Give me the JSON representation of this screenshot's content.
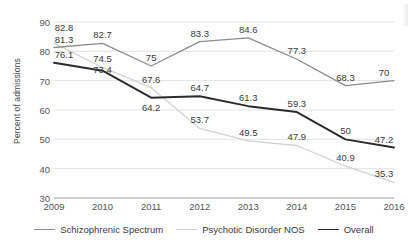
{
  "chart_data": {
    "type": "line",
    "title": "",
    "xlabel": "",
    "ylabel": "Percent of admissions",
    "categories": [
      "2009",
      "2010",
      "2011",
      "2012",
      "2013",
      "2014",
      "2015",
      "2016"
    ],
    "ylim": [
      30,
      90
    ],
    "yticks": [
      30,
      40,
      50,
      60,
      70,
      80,
      90
    ],
    "grid": true,
    "legend_position": "bottom",
    "series": [
      {
        "name": "Schizophrenic Spectrum",
        "color": "#8c8c8c",
        "values": [
          81.3,
          82.7,
          75,
          83.3,
          84.6,
          77.3,
          68.3,
          70
        ],
        "labels": [
          "81.3",
          "82.7",
          "75",
          "83.3",
          "84.6",
          "77.3",
          "68.3",
          "70"
        ]
      },
      {
        "name": "Psychotic Disorder NOS",
        "color": "#d2d2d2",
        "values": [
          82.8,
          74.5,
          67.6,
          53.7,
          49.5,
          47.9,
          40.9,
          35.3
        ],
        "labels": [
          "82.8",
          "74.5",
          "67.6",
          "53.7",
          "49.5",
          "47.9",
          "40.9",
          "35.3"
        ]
      },
      {
        "name": "Overall",
        "color": "#2b2b2b",
        "values": [
          76.1,
          73.4,
          64.2,
          64.7,
          61.3,
          59.3,
          50,
          47.2
        ],
        "labels": [
          "76.1",
          "73.4",
          "64.2",
          "64.7",
          "61.3",
          "59.3",
          "50",
          "47.2"
        ]
      }
    ]
  }
}
